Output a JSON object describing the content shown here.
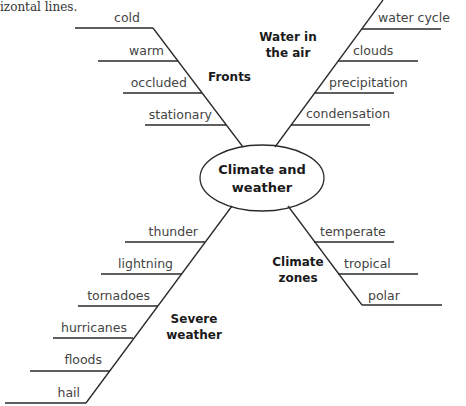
{
  "caption_fragment": "izontal lines.",
  "center": {
    "line1": "Climate and",
    "line2": "weather"
  },
  "branches": {
    "fronts": {
      "title": "Fronts",
      "items": [
        "cold",
        "warm",
        "occluded",
        "stationary"
      ]
    },
    "water": {
      "title_line1": "Water in",
      "title_line2": "the air",
      "items": [
        "water cycle",
        "clouds",
        "precipitation",
        "condensation"
      ]
    },
    "severe": {
      "title_line1": "Severe",
      "title_line2": "weather",
      "items": [
        "thunder",
        "lightning",
        "tornadoes",
        "hurricanes",
        "floods",
        "hail"
      ]
    },
    "zones": {
      "title_line1": "Climate",
      "title_line2": "zones",
      "items": [
        "temperate",
        "tropical",
        "polar"
      ]
    }
  },
  "colors": {
    "line": "#2a2a2a",
    "text": "#444444",
    "heading": "#1a1a1a"
  }
}
